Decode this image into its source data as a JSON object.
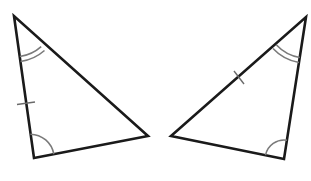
{
  "diagram": {
    "type": "congruent-triangles",
    "colors": {
      "edge": "#1a1a1a",
      "marker": "#7a7a7a",
      "background": "#ffffff"
    },
    "triangles": [
      {
        "id": "left",
        "vertices": {
          "top": [
            14,
            16
          ],
          "bottom": [
            34,
            158
          ],
          "right": [
            148,
            136
          ]
        },
        "markers": {
          "double_arc_at": "top",
          "single_arc_at": "bottom",
          "single_tick_on": "top-bottom"
        }
      },
      {
        "id": "right",
        "vertices": {
          "top": [
            306,
            17
          ],
          "bottom": [
            284,
            159
          ],
          "left": [
            171,
            136
          ]
        },
        "markers": {
          "double_arc_at": "top",
          "single_arc_at": "bottom",
          "single_tick_on": "top-left"
        }
      }
    ]
  }
}
